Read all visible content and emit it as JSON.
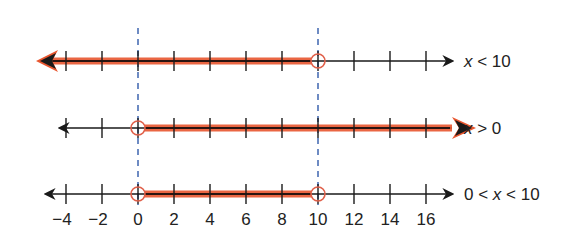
{
  "figure": {
    "type": "number_lines",
    "tick_values": [
      -4,
      -2,
      0,
      2,
      4,
      6,
      8,
      10,
      12,
      14,
      16
    ],
    "tick_labels": [
      "−4",
      "−2",
      "0",
      "2",
      "4",
      "6",
      "8",
      "10",
      "12",
      "14",
      "16"
    ],
    "colors": {
      "shade": "#e8562f",
      "axis": "#1a1a1a",
      "dashed_guide": "#4a6fb5",
      "open_circle": "#e0604a"
    },
    "guides": [
      0,
      10
    ],
    "lines": [
      {
        "label_parts": [
          "x",
          " < 10"
        ],
        "label": "x < 10",
        "shade_from": null,
        "shade_to": 10,
        "open_left": null,
        "open_right": 10
      },
      {
        "label_parts": [
          "x",
          " > 0"
        ],
        "label": "x > 0",
        "shade_from": 0,
        "shade_to": null,
        "open_left": 0,
        "open_right": null
      },
      {
        "label_parts": [
          "0 < ",
          "x",
          " < 10"
        ],
        "label": "0 < x < 10",
        "shade_from": 0,
        "shade_to": 10,
        "open_left": 0,
        "open_right": 10
      }
    ]
  }
}
